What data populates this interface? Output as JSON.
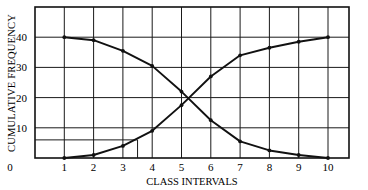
{
  "chart_data": {
    "type": "line",
    "title": "",
    "xlabel": "CLASS INTERVALS",
    "ylabel": "CUMULATIVE FREQUENCY",
    "x": [
      1,
      2,
      3,
      4,
      5,
      6,
      7,
      8,
      9,
      10
    ],
    "x_ticks": [
      "0",
      "1",
      "2",
      "3",
      "4",
      "5",
      "6",
      "7",
      "8",
      "9",
      "10"
    ],
    "y_ticks": [
      "10",
      "20",
      "30",
      "40"
    ],
    "xlim": [
      0,
      11
    ],
    "ylim": [
      0,
      50
    ],
    "grid": true,
    "legend": null,
    "series": [
      {
        "name": "Descending cumulative frequency",
        "values": [
          40,
          39,
          35.5,
          30.5,
          22,
          12.5,
          5.5,
          2.5,
          1,
          0
        ]
      },
      {
        "name": "Ascending cumulative frequency",
        "values": [
          0,
          1,
          4,
          9,
          17.5,
          27,
          34,
          36.5,
          38.5,
          40
        ]
      }
    ],
    "annotations": [
      {
        "type": "reference-lines",
        "y": 6,
        "x": 3.5,
        "description": "Horizontal line at ~6 from y-axis to ascending curve, dropped vertically to x-axis at ~3.5"
      }
    ],
    "intersection": {
      "x": 5.2,
      "y": 20
    }
  }
}
